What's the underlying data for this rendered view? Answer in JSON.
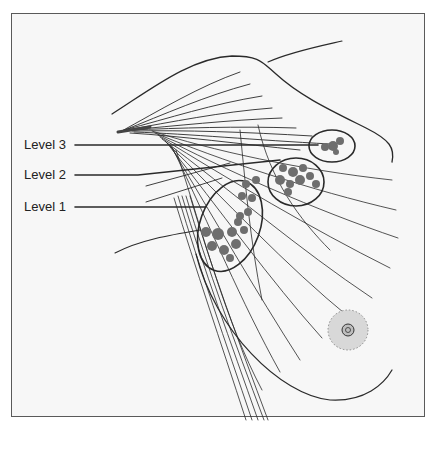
{
  "figure": {
    "type": "anatomical-diagram",
    "labels": [
      {
        "id": "level3",
        "text": "Level 3"
      },
      {
        "id": "level2",
        "text": "Level 2"
      },
      {
        "id": "level1",
        "text": "Level 1"
      }
    ],
    "colors": {
      "line": "#2a2a2a",
      "node_fill": "#6e6e6e",
      "background": "#f7f7f7",
      "frame": "#5a5a5a",
      "areola": "#d8d8d8"
    }
  }
}
